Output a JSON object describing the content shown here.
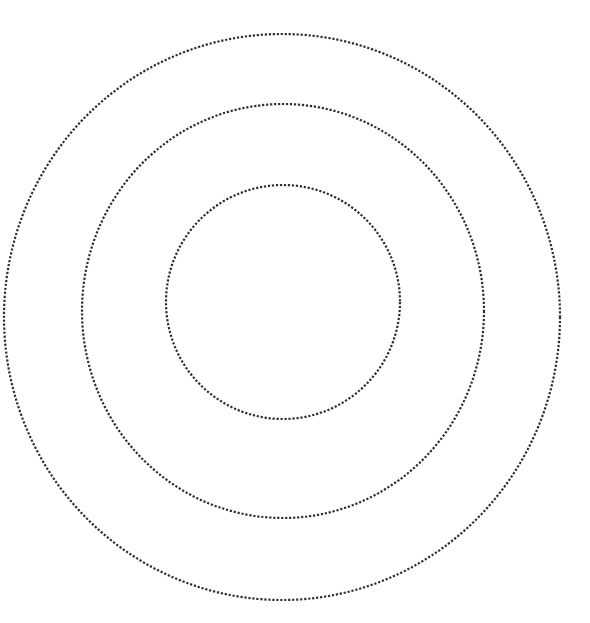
{
  "diagram": {
    "type": "concentric-circles",
    "background": "#ffffff",
    "stroke_color": "#2e2e2e",
    "stroke_style": "dotted",
    "rings": [
      {
        "id": "outer",
        "cx": 282,
        "cy": 317,
        "rx": 278,
        "ry": 283
      },
      {
        "id": "middle",
        "cx": 283,
        "cy": 311,
        "rx": 201,
        "ry": 207
      },
      {
        "id": "inner",
        "cx": 283,
        "cy": 302,
        "rx": 117,
        "ry": 117
      }
    ]
  }
}
